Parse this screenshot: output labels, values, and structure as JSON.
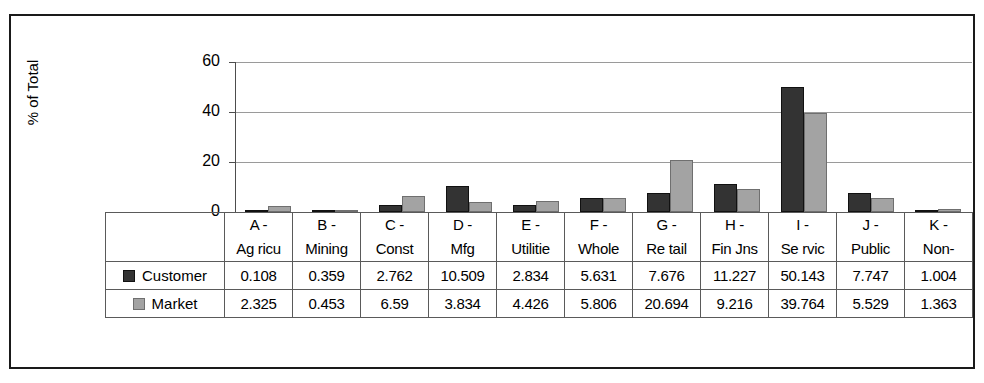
{
  "chart_data": {
    "type": "bar",
    "title": "",
    "xlabel": "",
    "ylabel": "% of Total",
    "ylim": [
      0,
      60
    ],
    "yticks": [
      0,
      20,
      40,
      60
    ],
    "grid": true,
    "legend_position": "table-row-labels",
    "categories": [
      "A - Agricu",
      "B - Mining",
      "C - Const",
      "D - Mfg",
      "E - Utilitie",
      "F - Whole",
      "G - Retail",
      "H - Fin Ins",
      "I - Servic",
      "J - Public",
      "K - Non-"
    ],
    "category_lines": [
      [
        "A -",
        "Ag ricu"
      ],
      [
        "B -",
        "Mining"
      ],
      [
        "C -",
        "Const"
      ],
      [
        "D -",
        "Mfg"
      ],
      [
        "E -",
        "Utilitie"
      ],
      [
        "F -",
        "Whole"
      ],
      [
        "G -",
        "Re tail"
      ],
      [
        "H -",
        "Fin Jns"
      ],
      [
        "I -",
        "Se rvic"
      ],
      [
        "J -",
        "Public"
      ],
      [
        "K -",
        "Non-"
      ]
    ],
    "series": [
      {
        "name": "Customer",
        "color": "#333333",
        "values": [
          0.108,
          0.359,
          2.762,
          10.509,
          2.834,
          5.631,
          7.676,
          11.227,
          50.143,
          7.747,
          1.004
        ],
        "value_labels": [
          "0.108",
          "0.359",
          "2.762",
          "10.509",
          "2.834",
          "5.631",
          "7.676",
          "11.227",
          "50.143",
          "7.747",
          "1.004"
        ]
      },
      {
        "name": "Market",
        "color": "#a3a3a3",
        "values": [
          2.325,
          0.453,
          6.59,
          3.834,
          4.426,
          5.806,
          20.694,
          9.216,
          39.764,
          5.529,
          1.363
        ],
        "value_labels": [
          "2.325",
          "0.453",
          "6.59",
          "3.834",
          "4.426",
          "5.806",
          "20.694",
          "9.216",
          "39.764",
          "5.529",
          "1.363"
        ]
      }
    ]
  },
  "axis": {
    "y_title": "% of Total",
    "y_tick_labels": [
      "60",
      "40",
      "20",
      "0"
    ]
  },
  "table": {
    "legend_labels": [
      "Customer",
      "Market"
    ]
  }
}
